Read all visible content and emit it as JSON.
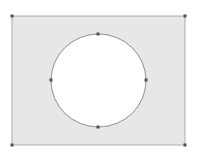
{
  "canvas": {
    "width": 197,
    "height": 153,
    "background": "#ffffff"
  },
  "shape": {
    "type": "rectangle-with-circular-hole",
    "fill": "#e7e7e7",
    "stroke": "#9a9a9a",
    "rect": {
      "x1": 12,
      "y1": 16,
      "x2": 185,
      "y2": 145
    },
    "hole": {
      "cx": 98.5,
      "cy": 80.5,
      "rx": 47.5,
      "ry": 46.5,
      "fill": "#ffffff"
    }
  },
  "handles": {
    "color": "#505050",
    "size": 3,
    "rect_corners": [
      {
        "name": "top-left",
        "x": 12,
        "y": 16
      },
      {
        "name": "top-right",
        "x": 185,
        "y": 16
      },
      {
        "name": "bottom-right",
        "x": 185,
        "y": 145
      },
      {
        "name": "bottom-left",
        "x": 12,
        "y": 145
      }
    ],
    "circle_points": [
      {
        "name": "top",
        "x": 98,
        "y": 34
      },
      {
        "name": "right",
        "x": 146,
        "y": 80
      },
      {
        "name": "bottom",
        "x": 98,
        "y": 127
      },
      {
        "name": "left",
        "x": 51,
        "y": 80
      }
    ]
  }
}
